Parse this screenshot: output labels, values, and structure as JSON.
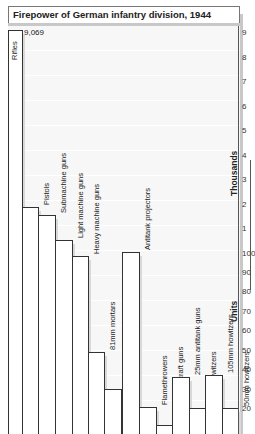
{
  "title": "Firepower of German infantry division, 1944",
  "chart_data": {
    "type": "bar",
    "title": "Firepower of German infantry division, 1944",
    "xlabel": "",
    "ylabel": "Thousands (upper scale) / Units (lower scale)",
    "axis_labels": {
      "upper": "Thousands",
      "lower": "Units"
    },
    "upper_ticks": [
      "9",
      "8",
      "7",
      "6",
      "5",
      "4",
      "3",
      "2",
      "1"
    ],
    "lower_ticks": [
      "100",
      "90",
      "80",
      "70",
      "60",
      "50",
      "40",
      "30",
      "20"
    ],
    "categories": [
      "Rifles",
      "Pistols",
      "Submachine guns",
      "Light machine guns",
      "Heavy machine guns",
      "81mm mortars",
      "120mm mortars",
      "Antitank projectors",
      "Flamethrowers",
      "20mm antiaircraft guns",
      "25mm antitank guns",
      "75mm howitzers",
      "105mm howitzers",
      "50mm howitzers"
    ],
    "values": [
      9069,
      1980,
      1600,
      550,
      95,
      48,
      30,
      100,
      20,
      12,
      36,
      20,
      37,
      20
    ],
    "annotations": [
      {
        "category": "Rifles",
        "text": "9,069"
      }
    ],
    "scale_note": "Broken axis: 1–9 thousands above 100 units; 20–100 units below",
    "grid": true,
    "legend": null
  },
  "bars": [
    {
      "label": "Rifles",
      "left": 0,
      "width": 14,
      "top": 30
    },
    {
      "label": "Pistols",
      "left": 14,
      "width": 16,
      "top": 207
    },
    {
      "label": "Submachine guns",
      "left": 30,
      "width": 17,
      "top": 215
    },
    {
      "label": "Light machine guns",
      "left": 47,
      "width": 17,
      "top": 240
    },
    {
      "label": "Heavy machine guns",
      "left": 64,
      "width": 16,
      "top": 256
    },
    {
      "label": "81mm mortars",
      "left": 80,
      "width": 16,
      "top": 352
    },
    {
      "label": "120mm mortars",
      "left": 96,
      "width": 17,
      "top": 389
    },
    {
      "label": "Antitank projectors",
      "left": 114,
      "width": 17,
      "top": 252
    },
    {
      "label": "Flamethrowers",
      "left": 131,
      "width": 17,
      "top": 407
    },
    {
      "label": "20mm antiaircraft guns",
      "left": 148,
      "width": 16,
      "top": 425
    },
    {
      "label": "25mm antitank guns",
      "left": 164,
      "width": 17,
      "top": 377
    },
    {
      "label": "75mm howitzers",
      "left": 181,
      "width": 16,
      "top": 408
    },
    {
      "label": "105mm howitzers",
      "left": 197,
      "width": 17,
      "top": 375
    },
    {
      "label": "50mm howitzers",
      "left": 214,
      "width": 16,
      "top": 408
    }
  ],
  "ticks": [
    {
      "label": "9",
      "y": 32
    },
    {
      "label": "8",
      "y": 57
    },
    {
      "label": "7",
      "y": 81
    },
    {
      "label": "6",
      "y": 106
    },
    {
      "label": "5",
      "y": 130
    },
    {
      "label": "4",
      "y": 155
    },
    {
      "label": "3",
      "y": 179
    },
    {
      "label": "2",
      "y": 204
    },
    {
      "label": "1",
      "y": 228
    },
    {
      "label": "100",
      "y": 253
    },
    {
      "label": "90",
      "y": 272
    },
    {
      "label": "80",
      "y": 291
    },
    {
      "label": "70",
      "y": 311
    },
    {
      "label": "60",
      "y": 330
    },
    {
      "label": "50",
      "y": 350
    },
    {
      "label": "40",
      "y": 369
    },
    {
      "label": "30",
      "y": 389
    },
    {
      "label": "20",
      "y": 408
    }
  ],
  "rifles_value_label": "9,069"
}
